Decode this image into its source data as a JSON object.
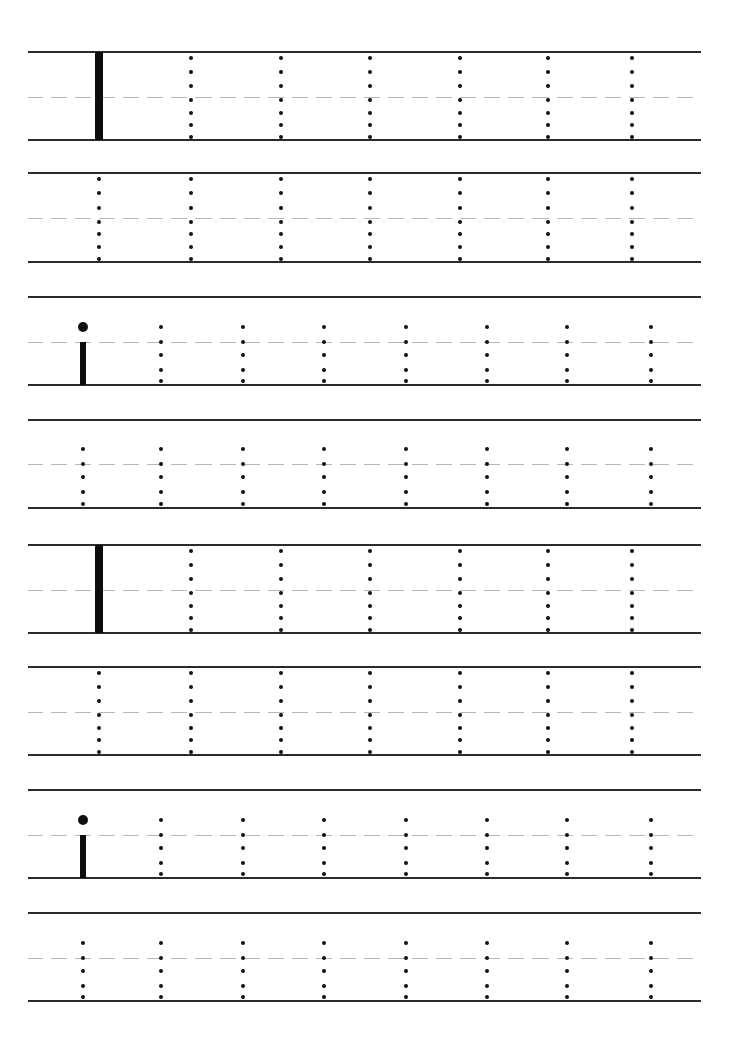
{
  "worksheet": {
    "title": "",
    "letter_upper": "I",
    "letter_lower": "i",
    "line_color": "#2a2a2a",
    "midline_color": "#b8b8b8",
    "ink_color": "#111111",
    "bands": [
      {
        "type": "upper",
        "example": true,
        "top": 52,
        "mid": 97,
        "bottom": 140
      },
      {
        "type": "upper",
        "example": false,
        "top": 173,
        "mid": 218,
        "bottom": 262
      },
      {
        "type": "lower",
        "example": true,
        "top": 297,
        "mid": 342,
        "bottom": 385
      },
      {
        "type": "lower",
        "example": false,
        "top": 420,
        "mid": 464,
        "bottom": 508
      },
      {
        "type": "upper",
        "example": true,
        "top": 545,
        "mid": 590,
        "bottom": 633
      },
      {
        "type": "upper",
        "example": false,
        "top": 667,
        "mid": 712,
        "bottom": 755
      },
      {
        "type": "lower",
        "example": true,
        "top": 790,
        "mid": 835,
        "bottom": 878
      },
      {
        "type": "lower",
        "example": false,
        "top": 913,
        "mid": 958,
        "bottom": 1001
      }
    ],
    "upper_columns_x": [
      99,
      191,
      281,
      370,
      460,
      548,
      632
    ],
    "lower_columns_x": [
      83,
      161,
      243,
      324,
      406,
      487,
      567,
      651
    ],
    "upper_traces_per_row": 7,
    "lower_traces_per_row": 8
  }
}
